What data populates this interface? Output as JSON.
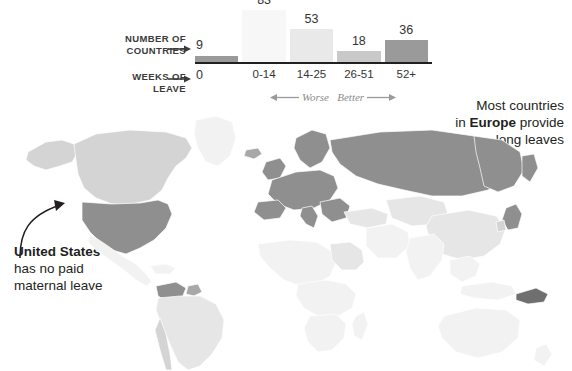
{
  "legend": {
    "row1_label": "NUMBER OF COUNTRIES",
    "row1_label_line1": "NUMBER OF",
    "row1_label_line2": "COUNTRIES",
    "row2_label_line1": "WEEKS OF",
    "row2_label_line2": "LEAVE",
    "zero_count": "9",
    "zero_weeks": "0",
    "scale_note_worse": "Worse",
    "scale_note_better": "Better"
  },
  "annotations": {
    "us": {
      "headline": "United States",
      "body_line1": "has no paid",
      "body_line2": "maternal leave"
    },
    "europe": {
      "line1": "Most countries",
      "line2_pre": "in ",
      "line2_bold": "Europe",
      "line2_post": " provide",
      "line3": "long leaves"
    }
  },
  "chart_data": {
    "type": "bar",
    "title": "",
    "xlabel": "WEEKS OF LEAVE",
    "ylabel": "NUMBER OF COUNTRIES",
    "categories": [
      "0",
      "0-14",
      "14-25",
      "26-51",
      "52+"
    ],
    "values": [
      9,
      83,
      53,
      18,
      36
    ],
    "colors": [
      "#9a9a9a",
      "#f7f7f7",
      "#e9e9e9",
      "#c9c9c9",
      "#9a9a9a"
    ],
    "ylim": [
      0,
      90
    ],
    "grid": false,
    "legend_position": "none",
    "annotations": [
      "Worse",
      "Better"
    ]
  },
  "map": {
    "type": "choropleth",
    "shades": {
      "none": "#9a9a9a",
      "low": "#f2f2f2",
      "mid_low": "#e6e6e6",
      "mid": "#d4d4d4",
      "high": "#a8a8a8"
    }
  }
}
